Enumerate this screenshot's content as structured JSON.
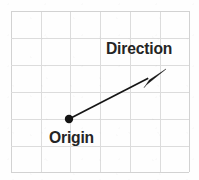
{
  "figure": {
    "title": "",
    "background_color": "#fefefe",
    "width": 199,
    "height": 180
  },
  "labels": {
    "direction": "Direction",
    "origin": "Origin"
  },
  "chart_data": {
    "type": "scatter",
    "title": "",
    "xlabel": "",
    "ylabel": "",
    "grid": true,
    "grid_color": "#dcdcdc",
    "grid_columns": 6,
    "grid_rows": 6,
    "grid_bounds": {
      "x0": 11,
      "y0": 11,
      "x1": 189,
      "y1": 172
    },
    "grid_vertical_lines": [
      11,
      41,
      70,
      100,
      130,
      160,
      189
    ],
    "grid_horizontal_lines": [
      11,
      38,
      65,
      92,
      119,
      146,
      172
    ],
    "xlim": [
      0,
      6
    ],
    "ylim": [
      0,
      6
    ],
    "legend_position": "none",
    "stroke_color": "#151515",
    "points": [
      {
        "name": "Origin",
        "label": "Origin",
        "px": 69,
        "py": 119,
        "x": 2,
        "y": 2,
        "marker": "filled-circle",
        "radius": 4.2
      }
    ],
    "vectors": [
      {
        "name": "direction-vector",
        "label": "Direction",
        "start_px": [
          69,
          119
        ],
        "end_px": [
          166,
          69
        ],
        "start": [
          2,
          2
        ],
        "end": [
          5.2,
          3.85
        ],
        "arrowhead": "filled-narrow-triangle",
        "color": "#151515"
      }
    ],
    "annotations": [
      {
        "text": "Direction",
        "px": 106,
        "py": 40,
        "anchor": "left-top",
        "bold": true
      },
      {
        "text": "Origin",
        "px": 49,
        "py": 129,
        "anchor": "left-top",
        "bold": true
      }
    ]
  }
}
